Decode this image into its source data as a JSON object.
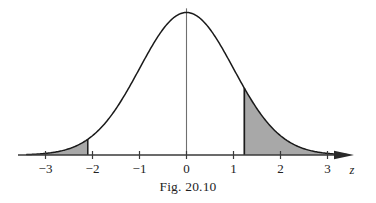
{
  "figure": {
    "caption": "Fig. 20.10",
    "axis_label": "z",
    "background_color": "#ffffff",
    "curve_color": "#1a1a1a",
    "shade_color": "#a8a8a8",
    "axis_color": "#3a3a3a",
    "center_line_color": "#6a6a6a"
  },
  "axis": {
    "ticks": [
      {
        "value": -3,
        "label": "−3"
      },
      {
        "value": -2,
        "label": "−2"
      },
      {
        "value": -1,
        "label": "−1"
      },
      {
        "value": 0,
        "label": "0"
      },
      {
        "value": 1,
        "label": "1"
      },
      {
        "value": 2,
        "label": "2"
      },
      {
        "value": 3,
        "label": "3"
      }
    ]
  },
  "chart_data": {
    "type": "area",
    "title": "Fig. 20.10",
    "subtitle": "",
    "xlabel": "z",
    "ylabel": "",
    "xlim": [
      -3.4,
      3.4
    ],
    "ylim": [
      0,
      0.42
    ],
    "grid": false,
    "legend_position": "none",
    "curve": {
      "name": "standard normal density",
      "distribution": "normal",
      "mean": 0,
      "sd": 1,
      "peak_value": 0.3989,
      "x": [
        -3.4,
        -3.2,
        -3.0,
        -2.8,
        -2.6,
        -2.4,
        -2.2,
        -2.0,
        -1.8,
        -1.6,
        -1.4,
        -1.2,
        -1.0,
        -0.8,
        -0.6,
        -0.4,
        -0.2,
        0.0,
        0.2,
        0.4,
        0.6,
        0.8,
        1.0,
        1.2,
        1.4,
        1.6,
        1.8,
        2.0,
        2.2,
        2.4,
        2.6,
        2.8,
        3.0,
        3.2,
        3.4
      ],
      "y": [
        0.0012,
        0.0024,
        0.0044,
        0.0079,
        0.0136,
        0.0224,
        0.0355,
        0.054,
        0.079,
        0.1109,
        0.1497,
        0.1942,
        0.242,
        0.2897,
        0.3332,
        0.3683,
        0.391,
        0.3989,
        0.391,
        0.3683,
        0.3332,
        0.2897,
        0.242,
        0.1942,
        0.1497,
        0.1109,
        0.079,
        0.054,
        0.0355,
        0.0224,
        0.0136,
        0.0079,
        0.0044,
        0.0024,
        0.0012
      ]
    },
    "center_line": {
      "x": 0,
      "y_top": 0.4105
    },
    "shaded_regions": [
      {
        "name": "left-tail",
        "from": -3.4,
        "to": -2.1,
        "boundary_at": -2.1,
        "fill": "#a8a8a8"
      },
      {
        "name": "right-tail",
        "from": 1.23,
        "to": 3.4,
        "boundary_at": 1.23,
        "fill": "#a8a8a8"
      }
    ],
    "annotations": []
  }
}
